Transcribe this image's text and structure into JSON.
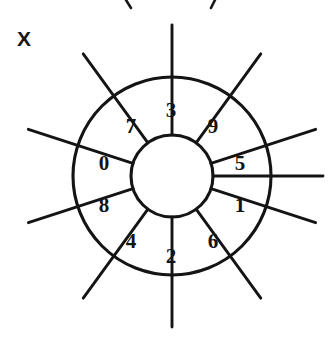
{
  "figure": {
    "type": "sector-wheel-diagram",
    "axis_label": "X",
    "background_color": "#ffffff",
    "ink_color": "#141414",
    "center": {
      "x": 172,
      "y": 176
    },
    "inner_radius": 41,
    "outer_radius": 99,
    "divider_extent_radius": 151,
    "sector_count": 10,
    "sectors": [
      {
        "digit": "3",
        "angle_deg": -72,
        "label_x": 171,
        "label_y": 112
      },
      {
        "digit": "9",
        "angle_deg": -36,
        "label_x": 213,
        "label_y": 128
      },
      {
        "digit": "5",
        "angle_deg": 0,
        "label_x": 240,
        "label_y": 165
      },
      {
        "digit": "1",
        "angle_deg": 36,
        "label_x": 240,
        "label_y": 207
      },
      {
        "digit": "6",
        "angle_deg": 72,
        "label_x": 213,
        "label_y": 243
      },
      {
        "digit": "2",
        "angle_deg": 108,
        "label_x": 171,
        "label_y": 258
      },
      {
        "digit": "4",
        "angle_deg": 144,
        "label_x": 131,
        "label_y": 243
      },
      {
        "digit": "8",
        "angle_deg": 180,
        "label_x": 104,
        "label_y": 207
      },
      {
        "digit": "0",
        "angle_deg": 216,
        "label_x": 104,
        "label_y": 165
      },
      {
        "digit": "7",
        "angle_deg": 252,
        "label_x": 131,
        "label_y": 128
      }
    ],
    "digit_sequence": [
      "0",
      "1",
      "2",
      "3",
      "4",
      "5",
      "6",
      "7",
      "8",
      "9"
    ],
    "divider_angles_deg": [
      0,
      18,
      54,
      90,
      126,
      162,
      198,
      234,
      270,
      306,
      342
    ],
    "top_crop_marks": [
      {
        "x1": 126,
        "y1": 0,
        "x2": 131,
        "y2": 8
      },
      {
        "x1": 215,
        "y1": 0,
        "x2": 211,
        "y2": 8
      }
    ]
  }
}
